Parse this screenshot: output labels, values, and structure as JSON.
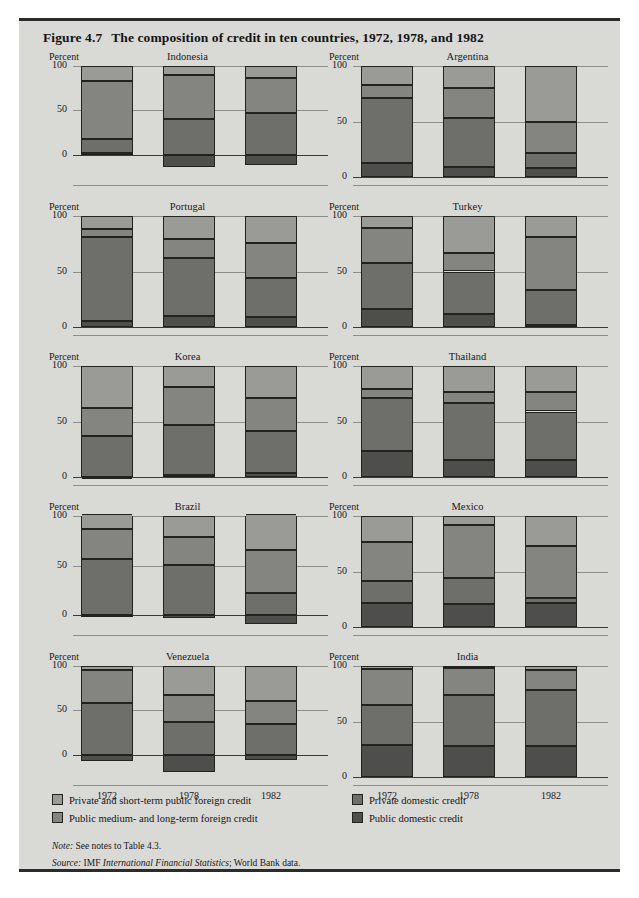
{
  "figure": {
    "number": "Figure 4.7",
    "title": "The composition of credit in ten countries, 1972, 1978, and 1982",
    "percent_label": "Percent",
    "years": [
      "1972",
      "1978",
      "1982"
    ],
    "y_ticks_standard": [
      "100",
      "50",
      "0"
    ]
  },
  "legend": {
    "items": [
      {
        "key": "private_foreign",
        "label": "Private and short-term public foreign credit",
        "color": "#9a9a97"
      },
      {
        "key": "public_foreign",
        "label": "Public medium- and long-term foreign credit",
        "color": "#848481"
      },
      {
        "key": "private_domestic",
        "label": "Private domestic credit",
        "color": "#6e6e6b"
      },
      {
        "key": "public_domestic",
        "label": "Public domestic credit",
        "color": "#4e4e4c"
      }
    ]
  },
  "notes": {
    "note_label": "Note:",
    "note_text": " See notes to Table 4.3.",
    "source_label": "Source:",
    "source_text_plain_1": " IMF ",
    "source_text_italic": "International Financial Statistics",
    "source_text_plain_2": "; World Bank data."
  },
  "chart_data": {
    "type": "bar",
    "subtype": "stacked-100-percent-with-negatives",
    "title": "The composition of credit in ten countries, 1972, 1978, and 1982",
    "xlabel": "",
    "ylabel": "Percent",
    "categories": [
      "1972",
      "1978",
      "1982"
    ],
    "series_order": [
      "public_domestic",
      "private_domestic",
      "public_foreign",
      "private_foreign"
    ],
    "series_names": {
      "public_domestic": "Public domestic credit",
      "private_domestic": "Private domestic credit",
      "public_foreign": "Public medium- and long-term foreign credit",
      "private_foreign": "Private and short-term public foreign credit"
    },
    "grid": true,
    "legend_position": "bottom",
    "panels": [
      {
        "name": "Indonesia",
        "ylim": [
          -25,
          100
        ],
        "yticks": [
          100,
          50,
          0
        ],
        "bars": [
          {
            "year": "1972",
            "public_domestic": 2,
            "private_domestic": 16,
            "public_foreign": 65,
            "private_foreign": 17
          },
          {
            "year": "1978",
            "public_domestic": -14,
            "private_domestic": 40,
            "public_foreign": 50,
            "private_foreign": 10
          },
          {
            "year": "1982",
            "public_domestic": -12,
            "private_domestic": 47,
            "public_foreign": 40,
            "private_foreign": 13
          }
        ]
      },
      {
        "name": "Argentina",
        "ylim": [
          0,
          100
        ],
        "yticks": [
          100,
          50,
          0
        ],
        "bars": [
          {
            "year": "1972",
            "public_domestic": 13,
            "private_domestic": 58,
            "public_foreign": 12,
            "private_foreign": 17
          },
          {
            "year": "1978",
            "public_domestic": 9,
            "private_domestic": 44,
            "public_foreign": 27,
            "private_foreign": 20
          },
          {
            "year": "1982",
            "public_domestic": 8,
            "private_domestic": 14,
            "public_foreign": 28,
            "private_foreign": 50
          }
        ]
      },
      {
        "name": "Portugal",
        "ylim": [
          0,
          100
        ],
        "yticks": [
          100,
          50,
          0
        ],
        "bars": [
          {
            "year": "1972",
            "public_domestic": 5,
            "private_domestic": 76,
            "public_foreign": 7,
            "private_foreign": 12
          },
          {
            "year": "1978",
            "public_domestic": 10,
            "private_domestic": 52,
            "public_foreign": 17,
            "private_foreign": 21
          },
          {
            "year": "1982",
            "public_domestic": 9,
            "private_domestic": 35,
            "public_foreign": 32,
            "private_foreign": 24
          }
        ]
      },
      {
        "name": "Turkey",
        "ylim": [
          0,
          100
        ],
        "yticks": [
          100,
          50,
          0
        ],
        "bars": [
          {
            "year": "1972",
            "public_domestic": 16,
            "private_domestic": 42,
            "public_foreign": 31,
            "private_foreign": 11
          },
          {
            "year": "1978",
            "public_domestic": 12,
            "private_domestic": 38,
            "public_foreign": 17,
            "private_foreign": 33
          },
          {
            "year": "1982",
            "public_domestic": 2,
            "private_domestic": 31,
            "public_foreign": 48,
            "private_foreign": 19
          }
        ]
      },
      {
        "name": "Korea",
        "ylim": [
          0,
          100
        ],
        "yticks": [
          100,
          50,
          0
        ],
        "bars": [
          {
            "year": "1972",
            "public_domestic": 0,
            "private_domestic": 37,
            "public_foreign": 25,
            "private_foreign": 38
          },
          {
            "year": "1978",
            "public_domestic": 2,
            "private_domestic": 45,
            "public_foreign": 34,
            "private_foreign": 19
          },
          {
            "year": "1982",
            "public_domestic": 4,
            "private_domestic": 37,
            "public_foreign": 30,
            "private_foreign": 29
          }
        ]
      },
      {
        "name": "Thailand",
        "ylim": [
          0,
          100
        ],
        "yticks": [
          100,
          50,
          0
        ],
        "bars": [
          {
            "year": "1972",
            "public_domestic": 23,
            "private_domestic": 48,
            "public_foreign": 8,
            "private_foreign": 21
          },
          {
            "year": "1978",
            "public_domestic": 15,
            "private_domestic": 52,
            "public_foreign": 10,
            "private_foreign": 23
          },
          {
            "year": "1982",
            "public_domestic": 15,
            "private_domestic": 44,
            "public_foreign": 18,
            "private_foreign": 23
          }
        ]
      },
      {
        "name": "Brazil",
        "ylim": [
          -12,
          100
        ],
        "yticks": [
          100,
          50,
          0
        ],
        "bars": [
          {
            "year": "1972",
            "public_domestic": -2,
            "private_domestic": 57,
            "public_foreign": 30,
            "private_foreign": 15
          },
          {
            "year": "1978",
            "public_domestic": -3,
            "private_domestic": 51,
            "public_foreign": 28,
            "private_foreign": 21
          },
          {
            "year": "1982",
            "public_domestic": -9,
            "private_domestic": 22,
            "public_foreign": 44,
            "private_foreign": 36
          }
        ]
      },
      {
        "name": "Mexico",
        "ylim": [
          0,
          100
        ],
        "yticks": [
          100,
          50,
          0
        ],
        "bars": [
          {
            "year": "1972",
            "public_domestic": 22,
            "private_domestic": 19,
            "public_foreign": 36,
            "private_foreign": 23
          },
          {
            "year": "1978",
            "public_domestic": 21,
            "private_domestic": 23,
            "public_foreign": 48,
            "private_foreign": 8
          },
          {
            "year": "1982",
            "public_domestic": 22,
            "private_domestic": 4,
            "public_foreign": 47,
            "private_foreign": 27
          }
        ]
      },
      {
        "name": "Venezuela",
        "ylim": [
          -25,
          100
        ],
        "yticks": [
          100,
          50,
          0
        ],
        "bars": [
          {
            "year": "1972",
            "public_domestic": -7,
            "private_domestic": 58,
            "public_foreign": 37,
            "private_foreign": 5
          },
          {
            "year": "1978",
            "public_domestic": -19,
            "private_domestic": 37,
            "public_foreign": 30,
            "private_foreign": 33
          },
          {
            "year": "1982",
            "public_domestic": -6,
            "private_domestic": 35,
            "public_foreign": 26,
            "private_foreign": 39
          }
        ]
      },
      {
        "name": "India",
        "ylim": [
          0,
          100
        ],
        "yticks": [
          100,
          50,
          0
        ],
        "bars": [
          {
            "year": "1972",
            "public_domestic": 29,
            "private_domestic": 36,
            "public_foreign": 32,
            "private_foreign": 3
          },
          {
            "year": "1978",
            "public_domestic": 28,
            "private_domestic": 46,
            "public_foreign": 24,
            "private_foreign": 2
          },
          {
            "year": "1982",
            "public_domestic": 28,
            "private_domestic": 50,
            "public_foreign": 18,
            "private_foreign": 4
          }
        ]
      }
    ]
  }
}
